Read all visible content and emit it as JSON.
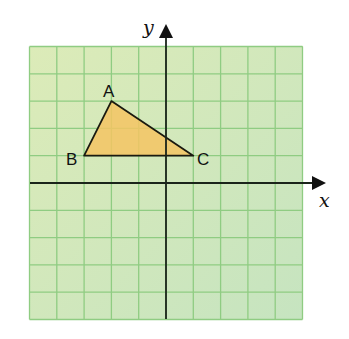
{
  "diagram": {
    "type": "coordinate-grid",
    "grid": {
      "columns": 10,
      "rows": 10,
      "x_range": [
        -5,
        5
      ],
      "y_range": [
        -5,
        5
      ],
      "unit_px": 27.3,
      "origin_px": [
        166,
        183
      ],
      "background_top": "#dcebb8",
      "background_bottom": "#c6e4c0",
      "line_color": "#8fcc82"
    },
    "axes": {
      "x_label": "x",
      "y_label": "y",
      "color": "#1a241a"
    },
    "triangle": {
      "fill": "#f5c463",
      "stroke": "#1a1a10",
      "vertices": [
        {
          "label": "A",
          "x": -2,
          "y": 3
        },
        {
          "label": "B",
          "x": -3,
          "y": 1
        },
        {
          "label": "C",
          "x": 1,
          "y": 1
        }
      ]
    }
  }
}
